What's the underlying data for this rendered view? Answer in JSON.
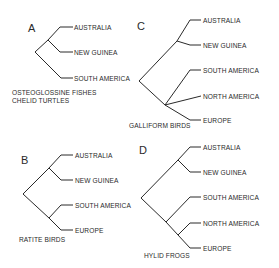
{
  "figure": {
    "panels": [
      {
        "id": "A",
        "letter": "A",
        "caption_lines": [
          "OSTEOGLOSSINE FISHES",
          "CHELID TURTLES"
        ],
        "tips": [
          "AUSTRALIA",
          "NEW GUINEA",
          "SOUTH AMERICA"
        ],
        "topology": "((AUSTRALIA, NEW GUINEA), SOUTH AMERICA)"
      },
      {
        "id": "B",
        "letter": "B",
        "caption_lines": [
          "RATITE BIRDS"
        ],
        "tips": [
          "AUSTRALIA",
          "NEW GUINEA",
          "SOUTH AMERICA",
          "EUROPE"
        ],
        "topology": "((AUSTRALIA, NEW GUINEA), (SOUTH AMERICA, EUROPE))"
      },
      {
        "id": "C",
        "letter": "C",
        "caption_lines": [
          "GALLIFORM BIRDS"
        ],
        "tips": [
          "AUSTRALIA",
          "NEW GUINEA",
          "SOUTH AMERICA",
          "NORTH AMERICA",
          "EUROPE"
        ],
        "topology": "((AUSTRALIA, NEW GUINEA), (SOUTH AMERICA, NORTH AMERICA, EUROPE))"
      },
      {
        "id": "D",
        "letter": "D",
        "caption_lines": [
          "HYLID FROGS"
        ],
        "tips": [
          "AUSTRALIA",
          "NEW GUINEA",
          "SOUTH AMERICA",
          "NORTH AMERICA",
          "EUROPE"
        ],
        "topology": "((AUSTRALIA, NEW GUINEA), (SOUTH AMERICA, (NORTH AMERICA, EUROPE)))"
      }
    ]
  }
}
